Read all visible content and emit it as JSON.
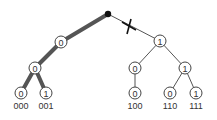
{
  "diagram": {
    "type": "binary-trie",
    "colors": {
      "thick_edge": "#555555",
      "thin_edge": "#555555",
      "node_stroke": "#444444",
      "root": "#111111",
      "cut_mark": "#111111"
    },
    "root": {
      "x": 108,
      "y": 14
    },
    "nodes": [
      {
        "id": "n0",
        "bit": "0",
        "x": 61,
        "y": 42
      },
      {
        "id": "n1",
        "bit": "1",
        "x": 160,
        "y": 41
      },
      {
        "id": "n00",
        "bit": "0",
        "x": 35,
        "y": 68
      },
      {
        "id": "n10",
        "bit": "0",
        "x": 135,
        "y": 68
      },
      {
        "id": "n11",
        "bit": "1",
        "x": 185,
        "y": 68
      },
      {
        "id": "n000",
        "bit": "0",
        "x": 21,
        "y": 93
      },
      {
        "id": "n001",
        "bit": "1",
        "x": 46,
        "y": 93
      },
      {
        "id": "n100",
        "bit": "0",
        "x": 135,
        "y": 93
      },
      {
        "id": "n110",
        "bit": "0",
        "x": 170,
        "y": 93
      },
      {
        "id": "n111",
        "bit": "1",
        "x": 196,
        "y": 93
      }
    ],
    "leaf_labels": [
      {
        "text": "000",
        "x": 21,
        "y": 109
      },
      {
        "text": "001",
        "x": 46,
        "y": 109
      },
      {
        "text": "100",
        "x": 135,
        "y": 109
      },
      {
        "text": "110",
        "x": 170,
        "y": 109
      },
      {
        "text": "111",
        "x": 196,
        "y": 109
      }
    ],
    "cut_mark": {
      "symbol": "X",
      "edge": "root-n1"
    }
  }
}
